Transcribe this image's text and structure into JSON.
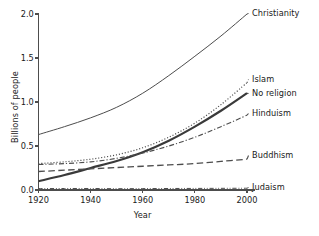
{
  "chart_data": {
    "type": "line",
    "title": "",
    "xlabel": "Year",
    "ylabel": "Billions of people",
    "xlim": [
      1920,
      2000
    ],
    "ylim": [
      0.0,
      2.0
    ],
    "xticks": [
      1920,
      1940,
      1960,
      1980,
      2000
    ],
    "xtick_labels": [
      "1920",
      "1940",
      "1960",
      "1980",
      "2000"
    ],
    "yticks": [
      0.0,
      0.5,
      1.0,
      1.5,
      2.0
    ],
    "ytick_labels": [
      "0.0",
      "0.5",
      "1.0",
      "1.5",
      "2.0"
    ],
    "grid": false,
    "legend_position": "right-edge-inline-labels",
    "x": [
      1920,
      1930,
      1940,
      1950,
      1960,
      1970,
      1980,
      1990,
      2000
    ],
    "series": [
      {
        "name": "Christianity",
        "linestyle": "solid",
        "linewidth": 1.0,
        "color": "#4d4d4d",
        "values": [
          0.63,
          0.72,
          0.82,
          0.94,
          1.1,
          1.3,
          1.52,
          1.75,
          2.0
        ],
        "label_value": "2.00"
      },
      {
        "name": "Islam",
        "linestyle": "dotted",
        "linewidth": 1.2,
        "color": "#4d4d4d",
        "values": [
          0.3,
          0.32,
          0.35,
          0.4,
          0.48,
          0.6,
          0.76,
          0.97,
          1.22
        ],
        "label_value": "1.22"
      },
      {
        "name": "No religion",
        "linestyle": "solid",
        "linewidth": 2.2,
        "color": "#3a3a3a",
        "values": [
          0.1,
          0.17,
          0.25,
          0.33,
          0.43,
          0.56,
          0.72,
          0.9,
          1.1
        ],
        "label_value": "1.10"
      },
      {
        "name": "Hinduism",
        "linestyle": "dashdot",
        "linewidth": 1.1,
        "color": "#4d4d4d",
        "values": [
          0.29,
          0.3,
          0.32,
          0.36,
          0.42,
          0.5,
          0.6,
          0.72,
          0.85
        ],
        "label_value": "0.85"
      },
      {
        "name": "Buddhism",
        "linestyle": "longdash",
        "linewidth": 1.3,
        "color": "#4d4d4d",
        "values": [
          0.21,
          0.225,
          0.24,
          0.255,
          0.27,
          0.285,
          0.3,
          0.325,
          0.35
        ],
        "label_value": "0.35"
      },
      {
        "name": "Judaism",
        "linestyle": "dashdotdot",
        "linewidth": 1.0,
        "color": "#4d4d4d",
        "values": [
          0.016,
          0.017,
          0.017,
          0.015,
          0.016,
          0.017,
          0.018,
          0.019,
          0.02
        ],
        "label_value": "0.02"
      }
    ]
  },
  "axes": {
    "spine_color": "#4d4d4d",
    "tick_color": "#4d4d4d"
  }
}
